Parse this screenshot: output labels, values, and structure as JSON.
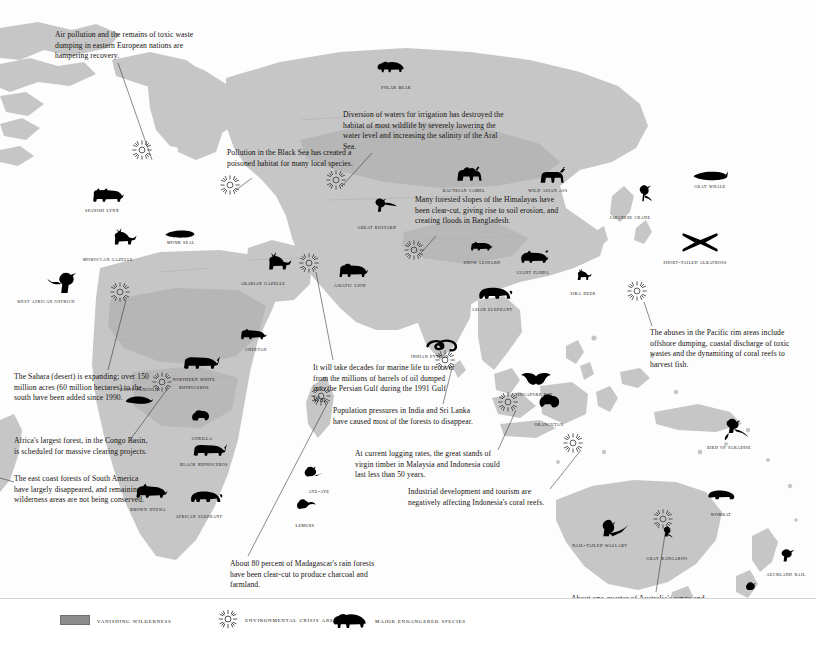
{
  "map": {
    "title": "Vanishing Wilderness and Endangered Species World Map",
    "colors": {
      "land": "#c6c6c6",
      "wilderness": "#a9a9a9",
      "ocean": "#ffffff",
      "silhouette": "#000000",
      "text": "#15110e"
    }
  },
  "legend": {
    "items": [
      {
        "key": "vanishing-wilderness",
        "label": "Vanishing Wilderness",
        "symbol": "gray-bar"
      },
      {
        "key": "environmental-crisis-area",
        "label": "Environmental Crisis Area",
        "symbol": "sunburst"
      },
      {
        "key": "major-endangered-species",
        "label": "Major Endangered Species",
        "symbol": "bear-silhouette"
      }
    ]
  },
  "notes": [
    {
      "id": "eastern-europe",
      "text": "Air pollution and the remains of toxic waste dumping in eastern European nations are hampering recovery.",
      "x": 55,
      "y": 30,
      "w": 160,
      "leader": [
        [
          118,
          63
        ],
        [
          152,
          160
        ]
      ]
    },
    {
      "id": "aral-sea",
      "text": "Diversion of waters for irrigation has destroyed the habitat of most wildlife by severely lowering the water level and increasing the salinity of the Aral Sea.",
      "x": 343,
      "y": 110,
      "w": 167,
      "leader": [
        [
          372,
          153
        ],
        [
          346,
          190
        ]
      ]
    },
    {
      "id": "black-sea",
      "text": "Pollution in the Black Sea has created a poisoned habitat for many local species.",
      "x": 227,
      "y": 148,
      "w": 140,
      "leader": [
        [
          253,
          180
        ],
        [
          240,
          194
        ]
      ]
    },
    {
      "id": "himalayas",
      "text": "Many forested slopes of the Himalayas have been clear-cut, giving rise to soil erosion, and creating floods in Bangladesh.",
      "x": 415,
      "y": 195,
      "w": 150,
      "leader": [
        [
          436,
          238
        ],
        [
          424,
          258
        ]
      ]
    },
    {
      "id": "pacific-rim",
      "text": "The abuses in the Pacific rim areas include offshore dumping, coastal discharge of toxic wastes and the dynamiting of coral reefs to harvest fish.",
      "x": 650,
      "y": 328,
      "w": 158,
      "leader": [
        [
          655,
          326
        ],
        [
          646,
          300
        ]
      ]
    },
    {
      "id": "sahara",
      "text": "The Sahara (desert) is expanding; over 150 million acres (60 million hectares) to the south have been added since 1990.",
      "x": 14,
      "y": 372,
      "w": 142,
      "leader": [
        [
          108,
          370
        ],
        [
          128,
          300
        ]
      ]
    },
    {
      "id": "persian-gulf",
      "text": "It will take decades for marine life to recover from the millions of barrels of oil dumped into the Persian Gulf during the 1991 Gulf War.",
      "x": 313,
      "y": 363,
      "w": 146,
      "leader": [
        [
          333,
          360
        ],
        [
          318,
          272
        ]
      ]
    },
    {
      "id": "india-sri-lanka",
      "text": "Population pressures in India and Sri Lanka have caused most of the forests to disappear.",
      "x": 333,
      "y": 406,
      "w": 150,
      "leader": [
        [
          443,
          405
        ],
        [
          455,
          370
        ]
      ]
    },
    {
      "id": "congo-basin",
      "text": "Africa's largest forest, in the Congo Basin, is scheduled for massive clearing projects.",
      "x": 14,
      "y": 436,
      "w": 140,
      "leader": [
        [
          130,
          440
        ],
        [
          170,
          390
        ]
      ]
    },
    {
      "id": "malaysia-indonesia",
      "text": "At current logging rates, the great stands of virgin timber in Malaysia and Indonesia could last less than 50 years.",
      "x": 355,
      "y": 449,
      "w": 146,
      "leader": [
        [
          498,
          450
        ],
        [
          518,
          412
        ]
      ]
    },
    {
      "id": "south-america-east-coast",
      "text": "The east coast forests of South America have largely disappeared, and remaining wilderness areas are not being conserved.",
      "x": 14,
      "y": 474,
      "w": 140,
      "leader": [
        [
          12,
          482
        ],
        [
          0,
          478
        ]
      ]
    },
    {
      "id": "indonesia-coral",
      "text": "Industrial development and tourism are negatively affecting Indonesia's coral reefs.",
      "x": 408,
      "y": 487,
      "w": 152,
      "leader": [
        [
          550,
          489
        ],
        [
          583,
          452
        ]
      ]
    },
    {
      "id": "madagascar",
      "text": "About 80 percent of Madagascar's rain forests have been clear-cut to produce charcoal and farmland.",
      "x": 230,
      "y": 559,
      "w": 150,
      "leader": [
        [
          248,
          558
        ],
        [
          330,
          404
        ]
      ]
    },
    {
      "id": "australia-desert",
      "text": "About one-quarter of Australia's range and cropland has become irreversible desert.",
      "x": 571,
      "y": 594,
      "w": 150,
      "leader": [
        [
          656,
          593
        ],
        [
          673,
          528
        ]
      ]
    }
  ],
  "species": [
    {
      "name": "Polar Bear",
      "icon": "bear",
      "lx": 373,
      "ly": 83,
      "ix": 376,
      "iy": 60,
      "w": 46
    },
    {
      "name": "Spanish Lynx",
      "icon": "lynx",
      "lx": 72,
      "ly": 206,
      "ix": 88,
      "iy": 186,
      "w": 60
    },
    {
      "name": "Moroccan Gazelle",
      "icon": "gazelle",
      "lx": 74,
      "ly": 255,
      "ix": 98,
      "iy": 227,
      "w": 68
    },
    {
      "name": "Monk Seal",
      "icon": "seal",
      "lx": 156,
      "ly": 238,
      "ix": 164,
      "iy": 227,
      "w": 50
    },
    {
      "name": "West African Ostrich",
      "icon": "ostrich",
      "lx": 3,
      "ly": 297,
      "ix": 40,
      "iy": 270,
      "w": 86
    },
    {
      "name": "Arabian Gazelle",
      "icon": "gazelle",
      "lx": 228,
      "ly": 279,
      "ix": 252,
      "iy": 251,
      "w": 70
    },
    {
      "name": "Great Bustard",
      "icon": "bustard",
      "lx": 349,
      "ly": 223,
      "ix": 366,
      "iy": 196,
      "w": 56
    },
    {
      "name": "Bactrian Camel",
      "icon": "camel",
      "lx": 433,
      "ly": 186,
      "ix": 452,
      "iy": 165,
      "w": 62
    },
    {
      "name": "Wild Asian Ass",
      "icon": "ass",
      "lx": 518,
      "ly": 186,
      "ix": 534,
      "iy": 167,
      "w": 60
    },
    {
      "name": "Gray Whale",
      "icon": "whale",
      "lx": 681,
      "ly": 182,
      "ix": 692,
      "iy": 168,
      "w": 58
    },
    {
      "name": "Japanese Crane",
      "icon": "crane",
      "lx": 600,
      "ly": 213,
      "ix": 626,
      "iy": 184,
      "w": 60
    },
    {
      "name": "Asiatic Lion",
      "icon": "lion",
      "lx": 322,
      "ly": 281,
      "ix": 334,
      "iy": 262,
      "w": 56
    },
    {
      "name": "Snow Leopard",
      "icon": "leopard",
      "lx": 462,
      "ly": 258,
      "ix": 468,
      "iy": 240,
      "w": 40
    },
    {
      "name": "Giant Panda",
      "icon": "panda",
      "lx": 506,
      "ly": 268,
      "ix": 518,
      "iy": 248,
      "w": 54
    },
    {
      "name": "Sika Deer",
      "icon": "deer",
      "lx": 561,
      "ly": 289,
      "ix": 568,
      "iy": 268,
      "w": 44
    },
    {
      "name": "Short-tailed Albatross",
      "icon": "albatross",
      "lx": 662,
      "ly": 258,
      "ix": 680,
      "iy": 232,
      "w": 66
    },
    {
      "name": "Asian Elephant",
      "icon": "elephant",
      "lx": 461,
      "ly": 305,
      "ix": 476,
      "iy": 283,
      "w": 62
    },
    {
      "name": "Cheetah",
      "icon": "cheetah",
      "lx": 232,
      "ly": 345,
      "ix": 238,
      "iy": 327,
      "w": 48
    },
    {
      "name": "Indian Python",
      "icon": "python",
      "lx": 402,
      "ly": 352,
      "ix": 424,
      "iy": 336,
      "w": 56
    },
    {
      "name": "Giant Pangolin",
      "icon": "pangolin",
      "lx": 117,
      "ly": 385,
      "ix": 124,
      "iy": 392,
      "w": 46
    },
    {
      "name": "Northern White Rhinoceros",
      "icon": "rhino",
      "lx": 162,
      "ly": 375,
      "ix": 180,
      "iy": 352,
      "w": 64
    },
    {
      "name": "Singapore Bat",
      "icon": "bat",
      "lx": 508,
      "ly": 390,
      "ix": 520,
      "iy": 372,
      "w": 52
    },
    {
      "name": "Gorilla",
      "icon": "gorilla",
      "lx": 180,
      "ly": 434,
      "ix": 188,
      "iy": 408,
      "w": 44
    },
    {
      "name": "Orangutan",
      "icon": "orangutan",
      "lx": 522,
      "ly": 420,
      "ix": 534,
      "iy": 392,
      "w": 54
    },
    {
      "name": "Bird of Paradise",
      "icon": "paradise",
      "lx": 695,
      "ly": 443,
      "ix": 712,
      "iy": 417,
      "w": 68
    },
    {
      "name": "Black Rhinoceros",
      "icon": "rhino",
      "lx": 174,
      "ly": 460,
      "ix": 190,
      "iy": 440,
      "w": 60
    },
    {
      "name": "Brown Hyena",
      "icon": "hyena",
      "lx": 118,
      "ly": 505,
      "ix": 132,
      "iy": 482,
      "w": 60
    },
    {
      "name": "African Elephant",
      "icon": "elephant",
      "lx": 170,
      "ly": 512,
      "ix": 188,
      "iy": 487,
      "w": 58
    },
    {
      "name": "Aye-aye",
      "icon": "ayeaye",
      "lx": 297,
      "ly": 487,
      "ix": 300,
      "iy": 465,
      "w": 44
    },
    {
      "name": "Lemurs",
      "icon": "lemur",
      "lx": 283,
      "ly": 521,
      "ix": 292,
      "iy": 497,
      "w": 44
    },
    {
      "name": "Wombat",
      "icon": "wombat",
      "lx": 697,
      "ly": 510,
      "ix": 706,
      "iy": 487,
      "w": 48
    },
    {
      "name": "Nail-tailed Wallaby",
      "icon": "wallaby",
      "lx": 563,
      "ly": 541,
      "ix": 585,
      "iy": 517,
      "w": 74
    },
    {
      "name": "Gray Kangaroo",
      "icon": "kangaroo",
      "lx": 646,
      "ly": 554,
      "ix": 656,
      "iy": 525,
      "w": 42
    },
    {
      "name": "Takahe",
      "icon": "takahe",
      "lx": 735,
      "ly": 603,
      "ix": 742,
      "iy": 580,
      "w": 36
    },
    {
      "name": "Auckland Rail",
      "icon": "rail",
      "lx": 762,
      "ly": 570,
      "ix": 774,
      "iy": 548,
      "w": 48
    }
  ],
  "crisis_markers": [
    {
      "id": "crisis-europe",
      "x": 142,
      "y": 150
    },
    {
      "id": "crisis-black-sea",
      "x": 230,
      "y": 185
    },
    {
      "id": "crisis-aral",
      "x": 336,
      "y": 180
    },
    {
      "id": "crisis-himalaya",
      "x": 414,
      "y": 250
    },
    {
      "id": "crisis-sahara",
      "x": 120,
      "y": 292
    },
    {
      "id": "crisis-persian-gulf",
      "x": 309,
      "y": 263
    },
    {
      "id": "crisis-congo",
      "x": 162,
      "y": 382
    },
    {
      "id": "crisis-india",
      "x": 445,
      "y": 360
    },
    {
      "id": "crisis-malaysia",
      "x": 508,
      "y": 402
    },
    {
      "id": "crisis-pacific",
      "x": 637,
      "y": 291
    },
    {
      "id": "crisis-madagascar",
      "x": 321,
      "y": 396
    },
    {
      "id": "crisis-indonesia",
      "x": 573,
      "y": 443
    },
    {
      "id": "crisis-australia",
      "x": 663,
      "y": 519
    }
  ]
}
